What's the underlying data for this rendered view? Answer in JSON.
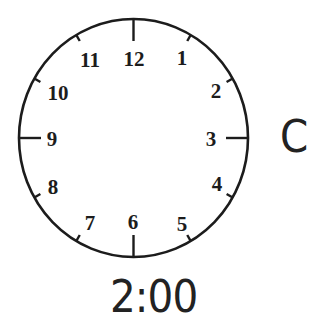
{
  "clock": {
    "center": {
      "x": 133.5,
      "y": 138
    },
    "radius": {
      "x": 114.5,
      "y": 119
    },
    "stroke_color": "#1c1c1c",
    "hands": "none",
    "numbers": [
      {
        "label": "12",
        "x": 134,
        "y": 66
      },
      {
        "label": "1",
        "x": 182,
        "y": 65
      },
      {
        "label": "2",
        "x": 216,
        "y": 98
      },
      {
        "label": "3",
        "x": 211,
        "y": 146
      },
      {
        "label": "4",
        "x": 217,
        "y": 191
      },
      {
        "label": "5",
        "x": 182,
        "y": 231
      },
      {
        "label": "6",
        "x": 133,
        "y": 229
      },
      {
        "label": "7",
        "x": 90,
        "y": 230
      },
      {
        "label": "8",
        "x": 53,
        "y": 194
      },
      {
        "label": "9",
        "x": 52,
        "y": 146
      },
      {
        "label": "10",
        "x": 58,
        "y": 100
      },
      {
        "label": "11",
        "x": 90,
        "y": 67
      }
    ]
  },
  "option_label": "C",
  "time_label": "2:00"
}
